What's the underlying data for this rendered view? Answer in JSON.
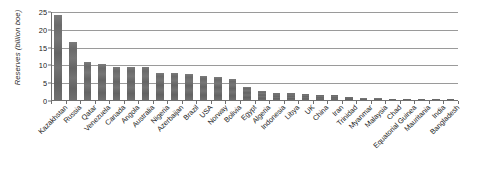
{
  "chart_data": {
    "type": "bar",
    "title": "",
    "subtitle": "",
    "xlabel": "",
    "ylabel": "Reserves (billion boe)",
    "ylim": [
      0,
      25
    ],
    "ytick_labels": [
      "0",
      "5",
      "10",
      "15",
      "20",
      "25"
    ],
    "ytick_values": [
      0,
      5,
      10,
      15,
      20,
      25
    ],
    "grid": true,
    "legend": false,
    "legend_position": "none",
    "bar_color": "#6b6b6b",
    "categories": [
      "Kazakhstan",
      "Russia",
      "Qatar",
      "Venezuela",
      "Canada",
      "Angola",
      "Australia",
      "Nigeria",
      "Azerbaijan",
      "Brazil",
      "USA",
      "Norway",
      "Bolivia",
      "Egypt",
      "Algeria",
      "Indonesia",
      "Libya",
      "UK",
      "China",
      "Iran",
      "Trinidad",
      "Myanmar",
      "Malaysia",
      "Chad",
      "Equatorial Guinea",
      "Mauritania",
      "India",
      "Bangladesh"
    ],
    "values": [
      23.9,
      16.3,
      10.6,
      10.0,
      9.3,
      9.3,
      9.2,
      7.7,
      7.5,
      7.2,
      6.7,
      6.6,
      5.9,
      3.6,
      2.5,
      2.0,
      2.0,
      1.6,
      1.4,
      1.3,
      0.9,
      0.7,
      0.6,
      0.4,
      0.3,
      0.2,
      0.2,
      0.1
    ]
  }
}
